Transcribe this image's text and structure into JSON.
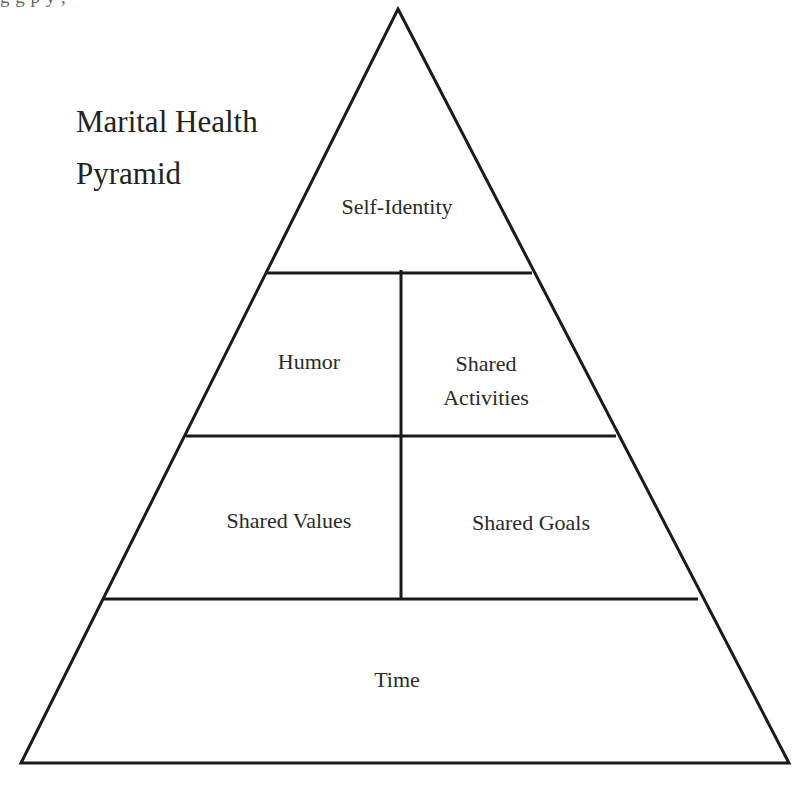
{
  "page": {
    "clipped_top_text": "     g         g              p              y                               ,"
  },
  "diagram": {
    "title_line1": "Marital Health",
    "title_line2": "Pyramid",
    "stroke_color": "#1a1a1a",
    "background_color": "#ffffff",
    "tiers": [
      {
        "level": 1,
        "position": "top",
        "cells": [
          {
            "label": "Self-Identity"
          }
        ]
      },
      {
        "level": 2,
        "position": "upper-middle",
        "cells": [
          {
            "label": "Humor"
          },
          {
            "label_line1": "Shared",
            "label_line2": "Activities"
          }
        ]
      },
      {
        "level": 3,
        "position": "lower-middle",
        "cells": [
          {
            "label": "Shared Values"
          },
          {
            "label": "Shared Goals"
          }
        ]
      },
      {
        "level": 4,
        "position": "base",
        "cells": [
          {
            "label": "Time"
          }
        ]
      }
    ]
  }
}
